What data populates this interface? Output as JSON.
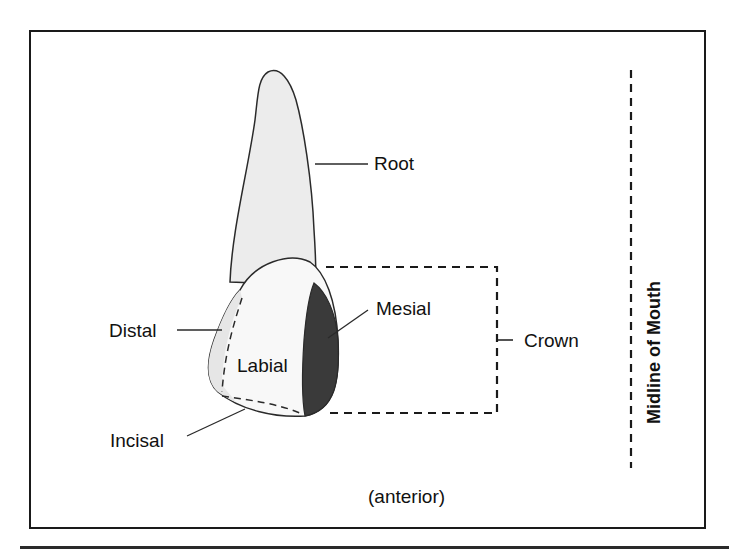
{
  "diagram": {
    "labels": {
      "root": "Root",
      "distal": "Distal",
      "labial": "Labial",
      "mesial": "Mesial",
      "crown": "Crown",
      "incisal": "Incisal",
      "midline": "Midline of Mouth",
      "view": "(anterior)"
    },
    "colors": {
      "outline": "#2a2a2a",
      "tooth_fill": "#efefef",
      "crown_fill": "#f8f8f8",
      "mesial_fill": "#3a3a3a",
      "text": "#111111"
    }
  }
}
